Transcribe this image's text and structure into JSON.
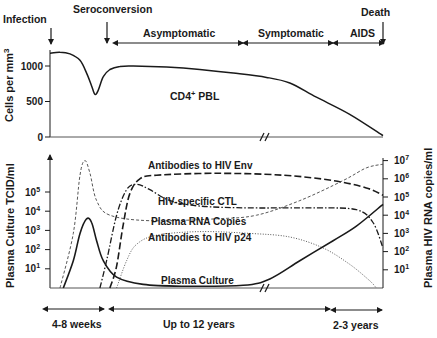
{
  "chart_data": [
    {
      "type": "line",
      "panel": "top",
      "ylabel": "Cells per mm³",
      "ylabel_base": "Cells per mm",
      "ylabel_sup": "3",
      "y_ticks": [
        {
          "value": 0,
          "label": "0"
        },
        {
          "value": 500,
          "label": "500"
        },
        {
          "value": 1000,
          "label": "1000"
        }
      ],
      "ylim": [
        0,
        1200
      ],
      "series": [
        {
          "name": "CD4+ PBL",
          "label_base": "CD4",
          "label_sup": "+",
          "label_rest": " PBL",
          "style": "solid",
          "points": [
            [
              0,
              1180
            ],
            [
              0.03,
              1195
            ],
            [
              0.06,
              1170
            ],
            [
              0.09,
              1080
            ],
            [
              0.11,
              900
            ],
            [
              0.125,
              720
            ],
            [
              0.135,
              600
            ],
            [
              0.145,
              660
            ],
            [
              0.16,
              850
            ],
            [
              0.18,
              950
            ],
            [
              0.21,
              995
            ],
            [
              0.25,
              1000
            ],
            [
              0.35,
              985
            ],
            [
              0.45,
              950
            ],
            [
              0.55,
              900
            ],
            [
              0.65,
              840
            ],
            [
              0.72,
              760
            ],
            [
              0.8,
              560
            ],
            [
              0.9,
              320
            ],
            [
              1.0,
              20
            ]
          ]
        }
      ]
    },
    {
      "type": "line",
      "panel": "bottom",
      "ylabel_left": "Plasma Culture TCID/ml",
      "ylabel_right": "Plasma HIV RNA copies/ml",
      "y_ticks_left": [
        {
          "exp": 1,
          "base": "10",
          "sup": "1"
        },
        {
          "exp": 2,
          "base": "10",
          "sup": "2"
        },
        {
          "exp": 3,
          "base": "10",
          "sup": "3"
        },
        {
          "exp": 4,
          "base": "10",
          "sup": "4"
        },
        {
          "exp": 5,
          "base": "10",
          "sup": "5"
        }
      ],
      "y_ticks_right": [
        {
          "exp": 1,
          "base": "10",
          "sup": "1"
        },
        {
          "exp": 2,
          "base": "10",
          "sup": "2"
        },
        {
          "exp": 3,
          "base": "10",
          "sup": "3"
        },
        {
          "exp": 4,
          "base": "10",
          "sup": "4"
        },
        {
          "exp": 5,
          "base": "10",
          "sup": "5"
        },
        {
          "exp": 6,
          "base": "10",
          "sup": "6"
        },
        {
          "exp": 7,
          "base": "10",
          "sup": "7"
        }
      ],
      "series": [
        {
          "name": "Antibodies to HIV Env",
          "style": "longdash",
          "points": [
            [
              0.18,
              0
            ],
            [
              0.2,
              1.2
            ],
            [
              0.22,
              3.5
            ],
            [
              0.24,
              5.2
            ],
            [
              0.27,
              6.0
            ],
            [
              0.32,
              6.2
            ],
            [
              0.5,
              6.3
            ],
            [
              0.7,
              6.2
            ],
            [
              0.85,
              5.9
            ],
            [
              0.95,
              5.5
            ],
            [
              1.0,
              5.1
            ]
          ]
        },
        {
          "name": "HIV-specific CTL",
          "style": "dashdot",
          "points": [
            [
              0.15,
              0
            ],
            [
              0.17,
              1.5
            ],
            [
              0.2,
              4.0
            ],
            [
              0.23,
              5.4
            ],
            [
              0.26,
              5.7
            ],
            [
              0.3,
              5.4
            ],
            [
              0.36,
              4.8
            ],
            [
              0.45,
              4.5
            ],
            [
              0.6,
              4.4
            ],
            [
              0.8,
              4.4
            ],
            [
              0.92,
              4.3
            ],
            [
              0.97,
              3.6
            ],
            [
              1.0,
              2.2
            ]
          ]
        },
        {
          "name": "Plasma RNA Copies",
          "style": "shortdash",
          "points": [
            [
              0.03,
              0
            ],
            [
              0.07,
              3.0
            ],
            [
              0.09,
              6.2
            ],
            [
              0.105,
              7.0
            ],
            [
              0.12,
              6.3
            ],
            [
              0.14,
              4.8
            ],
            [
              0.18,
              4.0
            ],
            [
              0.3,
              3.7
            ],
            [
              0.5,
              3.8
            ],
            [
              0.62,
              4.0
            ],
            [
              0.75,
              4.8
            ],
            [
              0.88,
              5.9
            ],
            [
              0.95,
              6.6
            ],
            [
              1.0,
              6.8
            ]
          ]
        },
        {
          "name": "Antibodies to HIV p24",
          "style": "dotted",
          "points": [
            [
              0.2,
              0
            ],
            [
              0.23,
              1.5
            ],
            [
              0.26,
              2.4
            ],
            [
              0.32,
              2.9
            ],
            [
              0.45,
              3.1
            ],
            [
              0.6,
              3.0
            ],
            [
              0.72,
              2.8
            ],
            [
              0.82,
              2.2
            ],
            [
              0.9,
              1.3
            ],
            [
              0.96,
              0.4
            ],
            [
              0.98,
              0
            ]
          ]
        },
        {
          "name": "Plasma Culture",
          "style": "solid",
          "points": [
            [
              0.04,
              0
            ],
            [
              0.07,
              1.5
            ],
            [
              0.09,
              3.0
            ],
            [
              0.11,
              3.8
            ],
            [
              0.125,
              3.6
            ],
            [
              0.14,
              2.6
            ],
            [
              0.16,
              1.5
            ],
            [
              0.2,
              0.6
            ],
            [
              0.28,
              0.2
            ],
            [
              0.4,
              0.1
            ],
            [
              0.58,
              0.15
            ],
            [
              0.66,
              0.5
            ],
            [
              0.75,
              1.5
            ],
            [
              0.85,
              2.6
            ],
            [
              0.92,
              3.4
            ],
            [
              1.0,
              4.6
            ]
          ]
        }
      ]
    }
  ],
  "phases": {
    "infection": "Infection",
    "seroconversion": "Seroconversion",
    "asymptomatic": "Asymptomatic",
    "symptomatic": "Symptomatic",
    "aids": "AIDS",
    "death": "Death"
  },
  "durations": {
    "early": "4-8 weeks",
    "middle": "Up to 12 years",
    "late": "2-3 years"
  },
  "axis_break": "//"
}
